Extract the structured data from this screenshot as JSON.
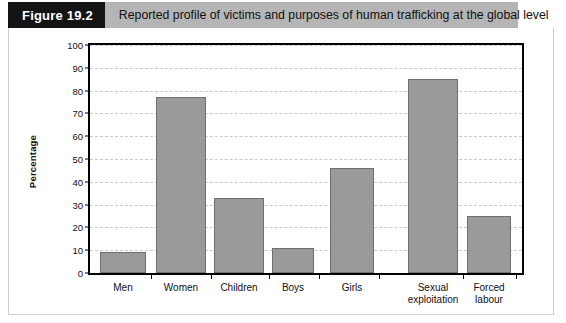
{
  "header": {
    "figure_tag": "Figure 19.2",
    "caption": "Reported profile of victims and purposes of human trafficking at the global level"
  },
  "chart_data": {
    "type": "bar",
    "title": "Reported profile of victims and purposes of human trafficking at the global level",
    "xlabel": "",
    "ylabel": "Percentage",
    "ylim": [
      0,
      100
    ],
    "ytick_step": 10,
    "grid": true,
    "legend": "none",
    "categories": [
      "Men",
      "Women",
      "Children",
      "Boys",
      "Girls",
      "Sexual\nexploitation",
      "Forced\nlabour"
    ],
    "values": [
      9,
      77,
      33,
      11,
      46,
      85,
      25
    ],
    "ytick_labels": [
      "0",
      "10",
      "20",
      "30",
      "40",
      "50",
      "60",
      "70",
      "80",
      "90",
      "100"
    ],
    "bar_color": "#9a9a9a",
    "bar_edge_color": "#6f6f6f"
  }
}
